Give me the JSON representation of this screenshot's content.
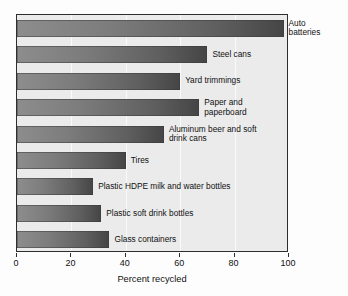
{
  "chart_data": {
    "type": "bar",
    "orientation": "horizontal",
    "title": "",
    "xlabel": "Percent recycled",
    "ylabel": "",
    "xlim": [
      0,
      100
    ],
    "xticks": [
      0,
      20,
      40,
      60,
      80,
      100
    ],
    "xtick_labels": [
      "0",
      "20",
      "40",
      "60",
      "80",
      "100"
    ],
    "grid": true,
    "legend": false,
    "categories": [
      "Auto batteries",
      "Steel cans",
      "Yard trimmings",
      "Paper and paperboard",
      "Aluminum beer and soft drink cans",
      "Tires",
      "Plastic HDPE milk and water bottles",
      "Plastic soft drink bottles",
      "Glass containers"
    ],
    "values": [
      98,
      70,
      60,
      67,
      54,
      40,
      28,
      31,
      34
    ],
    "bars": [
      {
        "label": "Auto\nbatteries",
        "category": "Auto batteries",
        "value": 98
      },
      {
        "label": "Steel cans",
        "category": "Steel cans",
        "value": 70
      },
      {
        "label": "Yard trimmings",
        "category": "Yard trimmings",
        "value": 60
      },
      {
        "label": "Paper and\npaperboard",
        "category": "Paper and paperboard",
        "value": 67
      },
      {
        "label": "Aluminum beer and soft\ndrink cans",
        "category": "Aluminum beer and soft drink cans",
        "value": 54
      },
      {
        "label": "Tires",
        "category": "Tires",
        "value": 40
      },
      {
        "label": "Plastic HDPE milk and water bottles",
        "category": "Plastic HDPE milk and water bottles",
        "value": 28
      },
      {
        "label": "Plastic soft drink bottles",
        "category": "Plastic soft drink bottles",
        "value": 31
      },
      {
        "label": "Glass containers",
        "category": "Glass containers",
        "value": 34
      }
    ],
    "colors": {
      "bar_light": "#8d8d8d",
      "bar_dark": "#454545",
      "plot_background": "#ebebeb",
      "axis": "#2e2e2e",
      "gridline": "#fafafa",
      "text": "#111111"
    }
  }
}
